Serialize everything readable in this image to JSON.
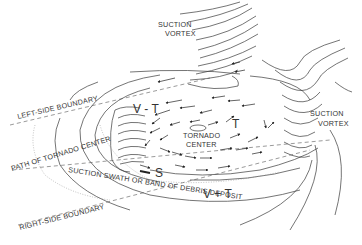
{
  "diagram": {
    "labels": {
      "suction_vortex_top": [
        "SUCTION",
        "VORTEX"
      ],
      "suction_vortex_right": [
        "SUCTION",
        "VORTEX"
      ],
      "left_side_boundary": "LEFT-SIDE BOUNDARY",
      "path_of_tornado_center": "PATH OF TORNADO CENTER",
      "suction_swath": "SUCTION SWATH OR BAND OF DEBRIS DEPOSIT",
      "right_side_boundary": "RIGHT-SIDE BOUNDARY",
      "tornado_center": [
        "TORNADO",
        "CENTER"
      ],
      "v_minus_t": "V - T",
      "v_plus_t": "V + T",
      "t_marker": "T",
      "s_marker": "S"
    },
    "colors": {
      "line": "#3a3a3a",
      "text": "#333333",
      "background": "#ffffff"
    }
  }
}
